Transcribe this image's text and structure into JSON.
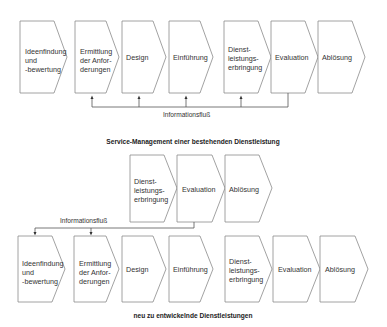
{
  "diagram_a": {
    "caption": "Service-Management einer bestehenden Dienstleistung",
    "flow_label": "Informationsfluß",
    "steps": [
      {
        "label": "Ideenfindung\nund\n-bewertung"
      },
      {
        "label": "Ermittlung\nder Anfor-\nderungen"
      },
      {
        "label": "Design"
      },
      {
        "label": "Einführung"
      },
      {
        "label": "Dienst-\nleistungs-\nerbringung"
      },
      {
        "label": "Evaluation"
      },
      {
        "label": "Ablösung"
      }
    ]
  },
  "diagram_b": {
    "caption": "neu zu entwickelnde Dienstleistungen",
    "flow_label": "Informationsfluß",
    "existing_steps": [
      {
        "label": "Dienst-\nleistungs-\nerbringung"
      },
      {
        "label": "Evaluation"
      },
      {
        "label": "Ablösung"
      }
    ],
    "steps": [
      {
        "label": "Ideenfindung\nund\n-bewertung"
      },
      {
        "label": "Ermittlung\nder Anfor-\nderungen"
      },
      {
        "label": "Design"
      },
      {
        "label": "Einführung"
      },
      {
        "label": "Dienst-\nleistungs-\nerbringung"
      },
      {
        "label": "Evaluation"
      },
      {
        "label": "Ablösung"
      }
    ]
  }
}
